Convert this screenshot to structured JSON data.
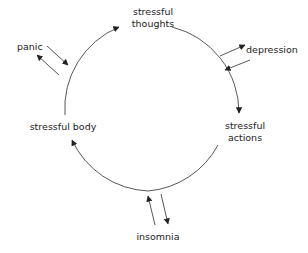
{
  "diagram": {
    "type": "cycle",
    "colors": {
      "line": "#333333",
      "text": "#222222",
      "background": "#ffffff"
    },
    "nodes": {
      "thoughts": {
        "line1": "stressful",
        "line2": "thoughts"
      },
      "actions": {
        "line1": "stressful",
        "line2": "actions"
      },
      "body": {
        "label": "stressful body"
      },
      "depression": {
        "label": "depression"
      },
      "panic": {
        "label": "panic"
      },
      "insomnia": {
        "label": "insomnia"
      }
    },
    "cycle_order": [
      "stressful thoughts",
      "stressful actions",
      "stressful body",
      "stressful thoughts"
    ],
    "side_links": [
      {
        "from": "stressful thoughts",
        "to": "depression",
        "bidirectional": true
      },
      {
        "from": "stressful body",
        "to": "panic",
        "bidirectional": true
      },
      {
        "from": "stressful actions",
        "to": "insomnia",
        "bidirectional": true
      }
    ]
  }
}
